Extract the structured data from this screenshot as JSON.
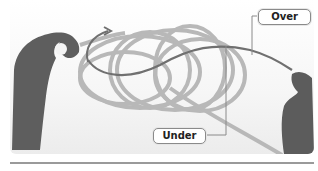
{
  "figure": {
    "labels": {
      "over": "Over",
      "under": "Under"
    },
    "colors": {
      "rope": "#b5b5b5",
      "working_strand": "#6a6a6a",
      "hand": "#5c5c5c",
      "leader_line": "#8a8a8a",
      "rule": "#9a9a9a"
    },
    "icons": {
      "arrow": "curved-arrow-icon"
    }
  }
}
